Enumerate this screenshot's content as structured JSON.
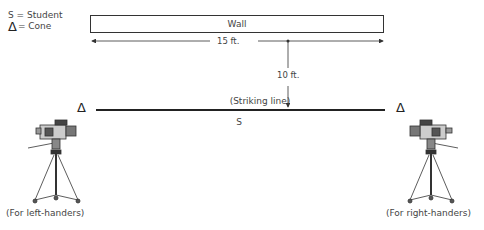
{
  "legend": {
    "items": [
      {
        "symbol": "S",
        "label": "= Student"
      },
      {
        "symbol": "Δ",
        "label": "= Cone"
      }
    ]
  },
  "wall": {
    "label": "Wall"
  },
  "dimensions": {
    "width": {
      "label": "15 ft."
    },
    "distance": {
      "label": "10 ft."
    }
  },
  "striking_line": {
    "label": "(Striking line)"
  },
  "student": {
    "symbol": "S"
  },
  "cones": {
    "left": "Δ",
    "right": "Δ"
  },
  "cameras": {
    "left": {
      "caption": "(For left-handers)",
      "icon": "camera-tripod-icon"
    },
    "right": {
      "caption": "(For right-handers)",
      "icon": "camera-tripod-icon"
    }
  },
  "colors": {
    "line": "#333333",
    "text": "#444444",
    "background": "#ffffff"
  }
}
